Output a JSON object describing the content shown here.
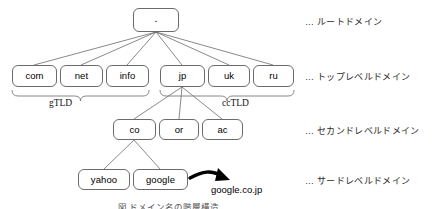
{
  "figure": {
    "caption": "図 ドメイン名の階層構造",
    "line_color": "#6b6b6b",
    "text_color": "#000000",
    "arrow_color": "#000000",
    "background": "#ffffff"
  },
  "nodes": {
    "root": {
      "label": ".",
      "x": 133,
      "y": 8,
      "w": 46,
      "h": 24
    },
    "tld": [
      {
        "label": "com",
        "x": 12,
        "y": 65,
        "w": 45,
        "h": 22
      },
      {
        "label": "net",
        "x": 60,
        "y": 65,
        "w": 43,
        "h": 22
      },
      {
        "label": "info",
        "x": 106,
        "y": 65,
        "w": 43,
        "h": 22
      },
      {
        "label": "jp",
        "x": 160,
        "y": 65,
        "w": 45,
        "h": 22
      },
      {
        "label": "uk",
        "x": 208,
        "y": 65,
        "w": 42,
        "h": 22
      },
      {
        "label": "ru",
        "x": 253,
        "y": 65,
        "w": 41,
        "h": 22
      }
    ],
    "second_level": [
      {
        "label": "co",
        "x": 113,
        "y": 119,
        "w": 43,
        "h": 21
      },
      {
        "label": "or",
        "x": 159,
        "y": 119,
        "w": 40,
        "h": 21
      },
      {
        "label": "ac",
        "x": 202,
        "y": 119,
        "w": 41,
        "h": 21
      }
    ],
    "third_level": [
      {
        "label": "yahoo",
        "x": 78,
        "y": 169,
        "w": 52,
        "h": 21
      },
      {
        "label": "google",
        "x": 133,
        "y": 169,
        "w": 55,
        "h": 21
      }
    ]
  },
  "braces": [
    {
      "name": "gtld",
      "label": "gTLD",
      "x1": 12,
      "x2": 149,
      "y": 90,
      "label_x": 49,
      "label_y": 98
    },
    {
      "name": "cctld",
      "label": "ccTLD",
      "x1": 160,
      "x2": 294,
      "y": 90,
      "label_x": 222,
      "label_y": 98
    }
  ],
  "side_labels": [
    {
      "name": "root-domain",
      "text": "… ルートドメイン",
      "x": 305,
      "y": 15
    },
    {
      "name": "top-level-domain",
      "text": "… トップレベルドメイン",
      "x": 305,
      "y": 70
    },
    {
      "name": "second-level-domain",
      "text": "… セカンドレベルドメイン",
      "x": 305,
      "y": 124
    },
    {
      "name": "third-level-domain",
      "text": "… サードレベルドメイン",
      "x": 305,
      "y": 174
    }
  ],
  "annotations": {
    "fqdn_example": {
      "text": "google.co.jp",
      "x": 211,
      "y": 184
    }
  },
  "edges": {
    "root_to_tld": [
      {
        "from": [
          156,
          32
        ],
        "to": [
          34,
          65
        ]
      },
      {
        "from": [
          156,
          32
        ],
        "to": [
          81,
          65
        ]
      },
      {
        "from": [
          156,
          32
        ],
        "to": [
          127,
          65
        ]
      },
      {
        "from": [
          156,
          32
        ],
        "to": [
          182,
          65
        ]
      },
      {
        "from": [
          156,
          32
        ],
        "to": [
          229,
          65
        ]
      },
      {
        "from": [
          156,
          32
        ],
        "to": [
          273,
          65
        ]
      }
    ],
    "jp_to_second": [
      {
        "from": [
          182,
          87
        ],
        "to": [
          134,
          119
        ]
      },
      {
        "from": [
          182,
          87
        ],
        "to": [
          179,
          119
        ]
      },
      {
        "from": [
          182,
          87
        ],
        "to": [
          222,
          119
        ]
      }
    ],
    "co_to_third": [
      {
        "from": [
          134,
          140
        ],
        "to": [
          104,
          169
        ]
      },
      {
        "from": [
          134,
          140
        ],
        "to": [
          160,
          169
        ]
      }
    ]
  }
}
